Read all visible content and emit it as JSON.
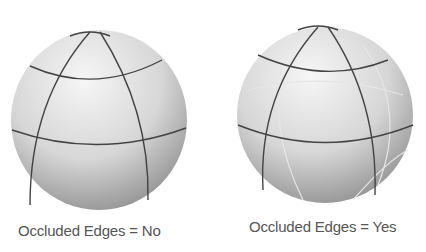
{
  "figures": [
    {
      "caption": "Occluded Edges = No",
      "occluded_edges": "No"
    },
    {
      "caption": "Occluded Edges = Yes",
      "occluded_edges": "Yes"
    }
  ],
  "colors": {
    "background": "#ffffff",
    "sphere_light": "#f4f4f4",
    "sphere_dark": "#8a8a8a",
    "edge_visible": "#444444",
    "edge_occluded": "#e6e6e6",
    "caption_text": "#555555"
  }
}
